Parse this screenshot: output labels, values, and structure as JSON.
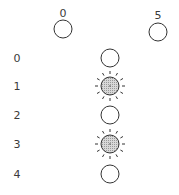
{
  "columns": [
    {
      "label": "0",
      "x": 63,
      "label_y": 13,
      "circle_y": 29,
      "lit": false
    },
    {
      "label": "5",
      "x": 158,
      "label_y": 15,
      "circle_y": 32,
      "lit": false
    }
  ],
  "rows": [
    {
      "label": "0",
      "y": 58,
      "lit": false
    },
    {
      "label": "1",
      "y": 86,
      "lit": true
    },
    {
      "label": "2",
      "y": 115,
      "lit": false
    },
    {
      "label": "3",
      "y": 144,
      "lit": true
    },
    {
      "label": "4",
      "y": 174,
      "lit": false
    }
  ],
  "row_label_x": 17,
  "row_circle_x": 110,
  "colors": {
    "stroke": "#333333",
    "lit_fill": "#c8c8c8"
  }
}
